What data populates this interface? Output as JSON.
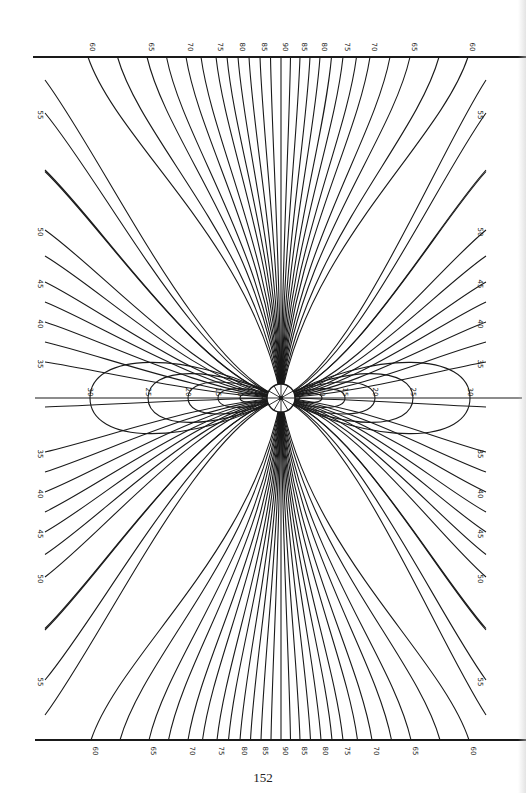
{
  "page": {
    "number": "152"
  },
  "diagram": {
    "title": "",
    "center": {
      "x": 281,
      "y": 398,
      "radius": 14,
      "spokes": 12
    },
    "frame": {
      "top_line": {
        "y": 57,
        "x1": 33,
        "x2": 526
      },
      "bottom_line": {
        "y": 740,
        "x1": 35,
        "x2": 526
      },
      "horizontal_axis": {
        "y": 398,
        "x1": 35,
        "x2": 522
      }
    },
    "top_labels": [
      {
        "value": "60",
        "x": 88
      },
      {
        "value": "65",
        "x": 147
      },
      {
        "value": "70",
        "x": 186
      },
      {
        "value": "75",
        "x": 216
      },
      {
        "value": "80",
        "x": 238
      },
      {
        "value": "85",
        "x": 260
      },
      {
        "value": "90",
        "x": 281
      },
      {
        "value": "85",
        "x": 300
      },
      {
        "value": "80",
        "x": 320
      },
      {
        "value": "75",
        "x": 343
      },
      {
        "value": "70",
        "x": 370
      },
      {
        "value": "65",
        "x": 410
      },
      {
        "value": "60",
        "x": 468
      }
    ],
    "bottom_labels": [
      {
        "value": "60",
        "x": 91
      },
      {
        "value": "65",
        "x": 149
      },
      {
        "value": "70",
        "x": 188
      },
      {
        "value": "75",
        "x": 217
      },
      {
        "value": "80",
        "x": 240
      },
      {
        "value": "85",
        "x": 261
      },
      {
        "value": "90",
        "x": 281
      },
      {
        "value": "85",
        "x": 300
      },
      {
        "value": "80",
        "x": 321
      },
      {
        "value": "75",
        "x": 343
      },
      {
        "value": "70",
        "x": 372
      },
      {
        "value": "65",
        "x": 411
      },
      {
        "value": "60",
        "x": 469
      }
    ],
    "left_labels": [
      {
        "value": "55",
        "y": 113
      },
      {
        "value": "50",
        "y": 230
      },
      {
        "value": "45",
        "y": 282
      },
      {
        "value": "40",
        "y": 322
      },
      {
        "value": "35",
        "y": 362
      },
      {
        "value": "35",
        "y": 452
      },
      {
        "value": "40",
        "y": 492
      },
      {
        "value": "45",
        "y": 532
      },
      {
        "value": "50",
        "y": 577
      },
      {
        "value": "55",
        "y": 680
      }
    ],
    "right_labels": [
      {
        "value": "55",
        "y": 113
      },
      {
        "value": "50",
        "y": 230
      },
      {
        "value": "45",
        "y": 282
      },
      {
        "value": "40",
        "y": 322
      },
      {
        "value": "35",
        "y": 362
      },
      {
        "value": "35",
        "y": 452
      },
      {
        "value": "40",
        "y": 492
      },
      {
        "value": "45",
        "y": 532
      },
      {
        "value": "50",
        "y": 577
      },
      {
        "value": "55",
        "y": 680
      }
    ],
    "ellipse_labels_left": [
      {
        "value": "30",
        "x": 90
      },
      {
        "value": "25",
        "x": 148
      },
      {
        "value": "20",
        "x": 188
      },
      {
        "value": "15",
        "x": 218
      },
      {
        "value": "10",
        "x": 240
      },
      {
        "value": "5",
        "x": 262
      }
    ],
    "ellipse_labels_right": [
      {
        "value": "5",
        "x": 300
      },
      {
        "value": "10",
        "x": 322
      },
      {
        "value": "15",
        "x": 345
      },
      {
        "value": "20",
        "x": 375
      },
      {
        "value": "25",
        "x": 413
      },
      {
        "value": "30",
        "x": 470
      }
    ],
    "colors": {
      "line": "#1a1a1a",
      "paper": "#ffffff"
    }
  }
}
